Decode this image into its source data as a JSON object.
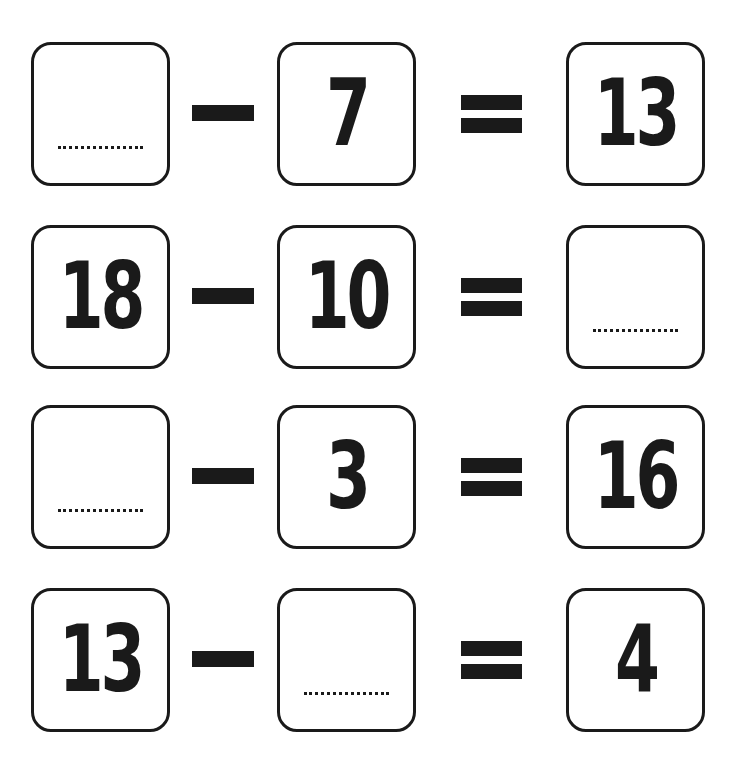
{
  "worksheet": {
    "rows": [
      {
        "a": "",
        "op": "-",
        "b": "7",
        "eq": "=",
        "c": "13"
      },
      {
        "a": "18",
        "op": "-",
        "b": "10",
        "eq": "=",
        "c": ""
      },
      {
        "a": "",
        "op": "-",
        "b": "3",
        "eq": "=",
        "c": "16"
      },
      {
        "a": "13",
        "op": "-",
        "b": "",
        "eq": "=",
        "c": "4"
      }
    ]
  },
  "colors": {
    "ink": "#1a1a1a",
    "background": "#ffffff"
  }
}
